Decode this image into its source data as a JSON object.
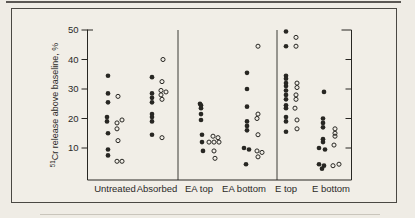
{
  "chart_data": {
    "type": "scatter",
    "title": "",
    "xlabel": "",
    "ylabel_superscript": "51",
    "ylabel_text": "Cr release above baseline, %",
    "ylabel_full": "51Cr release above baseline, %",
    "ylim": [
      0,
      50
    ],
    "yticks": [
      50,
      40,
      30,
      20,
      10
    ],
    "grid": false,
    "legend": "none",
    "marker_series": [
      "filled-circle",
      "open-circle"
    ],
    "categories": [
      {
        "label": "Untreated",
        "label_x": 115,
        "filled": [
          {
            "x": 108,
            "v": 34.5
          },
          {
            "x": 108,
            "v": 28.5
          },
          {
            "x": 108,
            "v": 25.5
          },
          {
            "x": 107,
            "v": 20.5
          },
          {
            "x": 107,
            "v": 19
          },
          {
            "x": 108,
            "v": 15
          },
          {
            "x": 108,
            "v": 9.5
          },
          {
            "x": 108,
            "v": 7.5
          }
        ],
        "open": [
          {
            "x": 118,
            "v": 27.5
          },
          {
            "x": 122,
            "v": 19.5
          },
          {
            "x": 117,
            "v": 18.5
          },
          {
            "x": 117,
            "v": 16.5
          },
          {
            "x": 118,
            "v": 12.5
          },
          {
            "x": 117,
            "v": 5.5
          },
          {
            "x": 122,
            "v": 5.5
          }
        ]
      },
      {
        "label": "Absorbed",
        "label_x": 157,
        "filled": [
          {
            "x": 152,
            "v": 34
          },
          {
            "x": 152,
            "v": 28.5
          },
          {
            "x": 152,
            "v": 27
          },
          {
            "x": 152,
            "v": 25.5
          },
          {
            "x": 152,
            "v": 21.5
          },
          {
            "x": 152,
            "v": 20.5
          },
          {
            "x": 152,
            "v": 19
          },
          {
            "x": 152,
            "v": 14.5
          }
        ],
        "open": [
          {
            "x": 163,
            "v": 40
          },
          {
            "x": 162,
            "v": 32.5
          },
          {
            "x": 161,
            "v": 29.5
          },
          {
            "x": 166,
            "v": 29
          },
          {
            "x": 161,
            "v": 28
          },
          {
            "x": 162,
            "v": 26.5
          },
          {
            "x": 162,
            "v": 13.5
          }
        ]
      },
      {
        "label": "EA top",
        "label_x": 199,
        "filled": [
          {
            "x": 200,
            "v": 25
          },
          {
            "x": 201,
            "v": 24.5
          },
          {
            "x": 201,
            "v": 23.5
          },
          {
            "x": 201,
            "v": 21.5
          },
          {
            "x": 201,
            "v": 19.5
          },
          {
            "x": 202,
            "v": 14.5
          },
          {
            "x": 202,
            "v": 12
          },
          {
            "x": 203,
            "v": 9
          }
        ],
        "open": [
          {
            "x": 213,
            "v": 14
          },
          {
            "x": 218,
            "v": 13.5
          },
          {
            "x": 209,
            "v": 12
          },
          {
            "x": 214,
            "v": 12
          },
          {
            "x": 219,
            "v": 12
          },
          {
            "x": 214,
            "v": 9
          },
          {
            "x": 215,
            "v": 6.5
          }
        ]
      },
      {
        "label": "EA bottom",
        "label_x": 244,
        "filled": [
          {
            "x": 247,
            "v": 35.5
          },
          {
            "x": 247,
            "v": 30
          },
          {
            "x": 247,
            "v": 24
          },
          {
            "x": 247,
            "v": 19
          },
          {
            "x": 247,
            "v": 17.5
          },
          {
            "x": 247,
            "v": 16
          },
          {
            "x": 244,
            "v": 10
          },
          {
            "x": 249,
            "v": 9.5
          },
          {
            "x": 246,
            "v": 4.5
          }
        ],
        "open": [
          {
            "x": 258,
            "v": 44.5
          },
          {
            "x": 258,
            "v": 21.5
          },
          {
            "x": 257,
            "v": 20
          },
          {
            "x": 258,
            "v": 14.5
          },
          {
            "x": 257,
            "v": 9
          },
          {
            "x": 262,
            "v": 8.5
          },
          {
            "x": 258,
            "v": 7
          }
        ]
      },
      {
        "label": "E top",
        "label_x": 286,
        "filled": [
          {
            "x": 286,
            "v": 49.5
          },
          {
            "x": 286,
            "v": 44.5
          },
          {
            "x": 286,
            "v": 34.5
          },
          {
            "x": 286,
            "v": 33.5
          },
          {
            "x": 286,
            "v": 32
          },
          {
            "x": 286,
            "v": 31
          },
          {
            "x": 286,
            "v": 29.5
          },
          {
            "x": 286,
            "v": 28
          },
          {
            "x": 286,
            "v": 26.5
          },
          {
            "x": 286,
            "v": 24.5
          },
          {
            "x": 286,
            "v": 23.5
          },
          {
            "x": 286,
            "v": 20.5
          },
          {
            "x": 286,
            "v": 19
          },
          {
            "x": 286,
            "v": 15.5
          }
        ],
        "open": [
          {
            "x": 296,
            "v": 47.5
          },
          {
            "x": 296,
            "v": 44.5
          },
          {
            "x": 297,
            "v": 32
          },
          {
            "x": 297,
            "v": 30.5
          },
          {
            "x": 296,
            "v": 28
          },
          {
            "x": 296,
            "v": 26.5
          },
          {
            "x": 295,
            "v": 23.5
          },
          {
            "x": 297,
            "v": 19.5
          },
          {
            "x": 297,
            "v": 16.5
          }
        ]
      },
      {
        "label": "E bottom",
        "label_x": 331,
        "filled": [
          {
            "x": 324,
            "v": 29
          },
          {
            "x": 323,
            "v": 20
          },
          {
            "x": 323,
            "v": 18.5
          },
          {
            "x": 323,
            "v": 17
          },
          {
            "x": 323,
            "v": 13
          },
          {
            "x": 323,
            "v": 12
          },
          {
            "x": 319,
            "v": 10
          },
          {
            "x": 325,
            "v": 9.5
          },
          {
            "x": 319,
            "v": 4.5
          },
          {
            "x": 324,
            "v": 4
          },
          {
            "x": 322,
            "v": 3
          }
        ],
        "open": [
          {
            "x": 335,
            "v": 16.5
          },
          {
            "x": 335,
            "v": 15
          },
          {
            "x": 335,
            "v": 14
          },
          {
            "x": 334,
            "v": 11
          },
          {
            "x": 333,
            "v": 4
          },
          {
            "x": 339,
            "v": 4.5
          }
        ]
      }
    ]
  }
}
